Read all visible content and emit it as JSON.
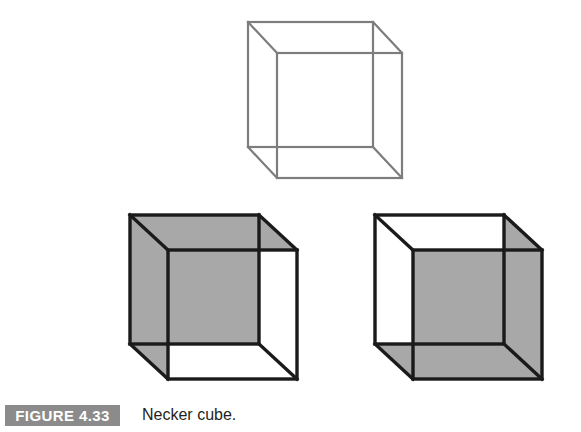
{
  "figure": {
    "number_label": "FIGURE 4.33",
    "caption": "Necker cube.",
    "badge_color": "#8b8b8b",
    "caption_color": "#231f20",
    "background_color": "#ffffff"
  },
  "diagram": {
    "title": "Necker cube",
    "type": "line-drawing",
    "stroke_colors": {
      "ambiguous_cube": "#7d7d7d",
      "disambiguated_cube": "#1a1a1a"
    },
    "fill_colors": {
      "shaded_face": "#a8a8a8",
      "unshaded_face": "#ffffff"
    },
    "stroke_widths": {
      "ambiguous_cube": 2.2,
      "disambiguated_cube": 3.4
    },
    "projection": {
      "depth_offset_x": 29,
      "depth_offset_y": -31,
      "note": "oblique projection; back square drawn up-left of front square"
    },
    "cubes": [
      {
        "name": "ambiguous-cube",
        "position": "top-center",
        "shading": "none",
        "interpretation": "bistable / ambiguous",
        "front_square": {
          "x": 277,
          "y": 53,
          "size": 125
        },
        "back_square": {
          "x": 248,
          "y": 22,
          "size": 125
        }
      },
      {
        "name": "back-face-forward-cube",
        "position": "bottom-left",
        "shading": "upper-left square shaded",
        "interpretation": "upper-left square read as the near face",
        "front_square": {
          "x": 168,
          "y": 250,
          "size": 129
        },
        "back_square": {
          "x": 130,
          "y": 215,
          "size": 129
        },
        "shaded_faces": [
          "back-square",
          "left-side",
          "top-side"
        ]
      },
      {
        "name": "front-face-forward-cube",
        "position": "bottom-right",
        "shading": "lower-right square shaded",
        "interpretation": "lower-right square read as the near face",
        "front_square": {
          "x": 413,
          "y": 250,
          "size": 129
        },
        "back_square": {
          "x": 375,
          "y": 215,
          "size": 129
        },
        "shaded_faces": [
          "front-square",
          "right-side",
          "bottom-side"
        ]
      }
    ]
  }
}
